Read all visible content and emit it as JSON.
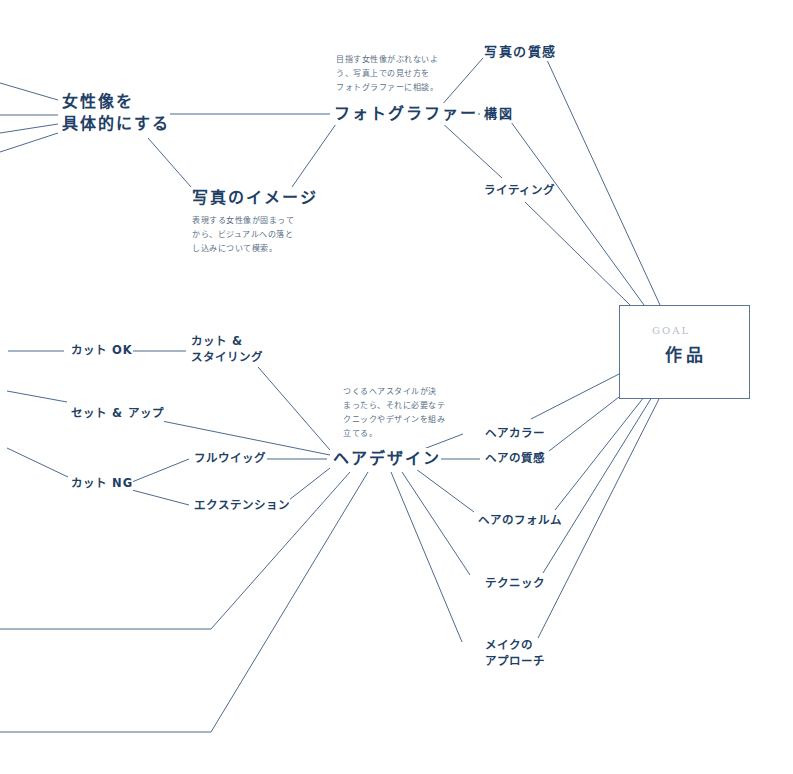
{
  "goal": {
    "label": "GOAL",
    "title": "作品"
  },
  "nodes": {
    "josei_zou": {
      "line1": "女性像を",
      "line2": "具体的にする"
    },
    "photographer": "フォトグラファー",
    "photographer_note": [
      "目指す女性像がぶれないよ",
      "う、写真上での見せ方を",
      "フォトグラファーに相談。"
    ],
    "shashin_image": "写真のイメージ",
    "shashin_image_note": [
      "表現する女性像が固まって",
      "から、ビジュアルへの落と",
      "し込みについて模索。"
    ],
    "shashin_shitsukan": "写真の質感",
    "kouzu": "構図",
    "lighting": "ライティング",
    "cut_ok": "カット OK",
    "cut_styling": {
      "line1": "カット &",
      "line2": "スタイリング"
    },
    "set_up": "セット & アップ",
    "cut_ng": "カット NG",
    "full_wig": "フルウイッグ",
    "extension": "エクステンション",
    "hair_design": "ヘアデザイン",
    "hair_design_note": [
      "つくるヘアスタイルが決",
      "まったら、それに必要なテ",
      "クニックやデザインを組み",
      "立てる。"
    ],
    "hair_color": "ヘアカラー",
    "hair_shitsukan": "ヘアの質感",
    "hair_form": "ヘアのフォルム",
    "technique": "テクニック",
    "make_approach": {
      "line1": "メイクの",
      "line2": "アプローチ"
    }
  },
  "colors": {
    "text": "#1e3f66",
    "line": "#4d6a8c",
    "note": "#5a6f88",
    "goal_label": "#b5bec9"
  }
}
